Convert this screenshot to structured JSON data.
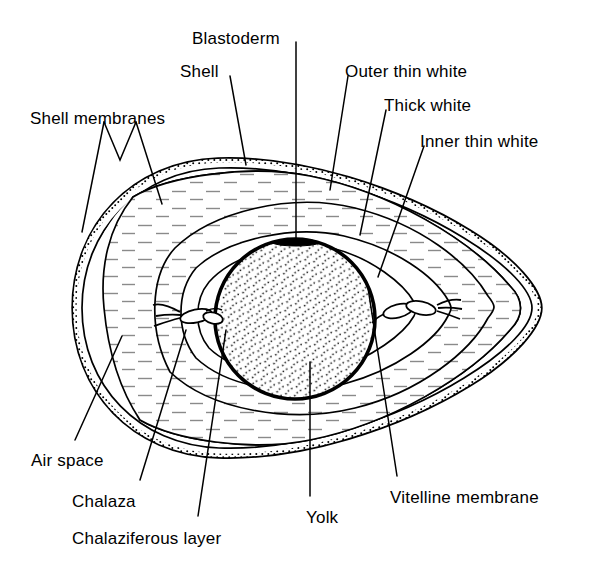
{
  "figure": {
    "background_color": "#ffffff",
    "ink_color": "#000000",
    "hatch_color": "#8a8a8a"
  },
  "labels": [
    {
      "id": "blastoderm",
      "text": "Blastoderm",
      "x": 192,
      "y": 30,
      "anchor": "start"
    },
    {
      "id": "shell",
      "text": "Shell",
      "x": 180,
      "y": 63,
      "anchor": "start"
    },
    {
      "id": "outer-thin-white",
      "text": "Outer thin white",
      "x": 345,
      "y": 63,
      "anchor": "start"
    },
    {
      "id": "shell-membranes",
      "text": "Shell membranes",
      "x": 30,
      "y": 110,
      "anchor": "start"
    },
    {
      "id": "thick-white",
      "text": "Thick white",
      "x": 384,
      "y": 97,
      "anchor": "start"
    },
    {
      "id": "inner-thin-white",
      "text": "Inner thin white",
      "x": 420,
      "y": 133,
      "anchor": "start"
    },
    {
      "id": "air-space",
      "text": "Air space",
      "x": 31,
      "y": 452,
      "anchor": "start"
    },
    {
      "id": "chalaza",
      "text": "Chalaza",
      "x": 72,
      "y": 493,
      "anchor": "start"
    },
    {
      "id": "chalaziferous",
      "text": "Chalaziferous layer",
      "x": 72,
      "y": 530,
      "anchor": "start"
    },
    {
      "id": "yolk",
      "text": "Yolk",
      "x": 306,
      "y": 509,
      "anchor": "start"
    },
    {
      "id": "vitelline-membrane",
      "text": "Vitelline membrane",
      "x": 390,
      "y": 489,
      "anchor": "start"
    }
  ],
  "structures": [
    {
      "id": "shell",
      "name": "Shell",
      "description": "Outer calcified shell, drawn as a thick stippled band around the whole egg"
    },
    {
      "id": "shell-membranes",
      "name": "Shell membranes",
      "description": "Two thin lines just inside the shell, separating at the blunt end"
    },
    {
      "id": "air-space",
      "name": "Air space",
      "description": "Lens-shaped gap between shell membranes at the blunt (left) end"
    },
    {
      "id": "outer-thin-white",
      "name": "Outer thin white",
      "description": "Outermost albumen layer, hatched"
    },
    {
      "id": "thick-white",
      "name": "Thick white",
      "description": "Dense albumen layer surrounding the yolk, hatched"
    },
    {
      "id": "inner-thin-white",
      "name": "Inner thin white",
      "description": "Thin albumen layer immediately around the chalaziferous layer"
    },
    {
      "id": "chalaziferous",
      "name": "Chalaziferous layer",
      "description": "Unhatched band wrapping the yolk, continuing into the chalazae"
    },
    {
      "id": "chalaza",
      "name": "Chalaza",
      "description": "Twisted rope-like cords at each pole of the yolk"
    },
    {
      "id": "vitelline-membrane",
      "name": "Vitelline membrane",
      "description": "Thick dark circle enclosing the yolk"
    },
    {
      "id": "yolk",
      "name": "Yolk",
      "description": "Central stippled sphere"
    },
    {
      "id": "blastoderm",
      "name": "Blastoderm",
      "description": "Small dark patch on the upper surface of the yolk"
    }
  ],
  "geometry": {
    "egg_center": {
      "x": 300,
      "y": 308
    },
    "yolk_center": {
      "x": 295,
      "y": 319
    },
    "yolk_radius": 80,
    "egg_left_tip_x": 73,
    "egg_right_tip_x": 541,
    "egg_top_y": 157,
    "egg_bottom_y": 458
  }
}
